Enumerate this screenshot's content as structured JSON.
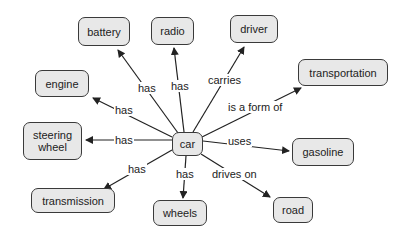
{
  "diagram": {
    "type": "concept-map",
    "center": "car",
    "nodes": {
      "car": "car",
      "battery": "battery",
      "radio": "radio",
      "driver": "driver",
      "engine": "engine",
      "transportation": "transportation",
      "steering_wheel": "steering wheel",
      "gasoline": "gasoline",
      "transmission": "transmission",
      "wheels": "wheels",
      "road": "road"
    },
    "edges": {
      "battery": "has",
      "radio": "has",
      "driver": "carries",
      "engine": "has",
      "transportation": "is a form of",
      "steering_wheel": "has",
      "gasoline": "uses",
      "transmission": "has",
      "wheels": "has",
      "road": "drives on"
    },
    "colors": {
      "node_fill": "#e8e8e8",
      "node_border": "#3a3a3a",
      "line": "#222222"
    }
  }
}
